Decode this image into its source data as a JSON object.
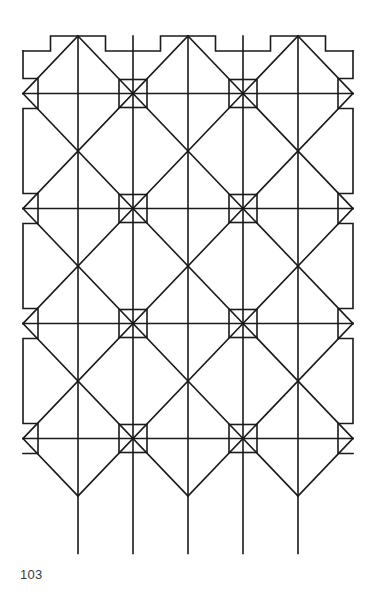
{
  "page": {
    "number": "103",
    "background_color": "#ffffff",
    "width": 373,
    "height": 608
  },
  "figure": {
    "name": "Geometric tessellation pattern of interlocking diamonds with square nodes",
    "line_color": "#1a1a1a",
    "fill_color": "none",
    "stroke_width": 1.6,
    "geometry": {
      "origin_x": 23,
      "origin_y": 36,
      "cell_width": 110,
      "cell_height": 115,
      "columns": 3,
      "rows": 4,
      "node_columns_x": [
        78,
        188,
        298
      ],
      "square_columns_x": [
        133,
        243
      ],
      "crossing_rows_y": [
        93,
        208,
        323,
        438
      ],
      "square_rows_y": [
        150,
        265,
        380,
        495
      ],
      "horizontal_rule_rows_y": [
        151,
        266,
        381,
        496
      ],
      "square_size": 28,
      "border_top_y": 36,
      "border_left_x": 23,
      "border_right_x": 350,
      "notch_depth": 15,
      "bottom_point_y": 552
    }
  }
}
